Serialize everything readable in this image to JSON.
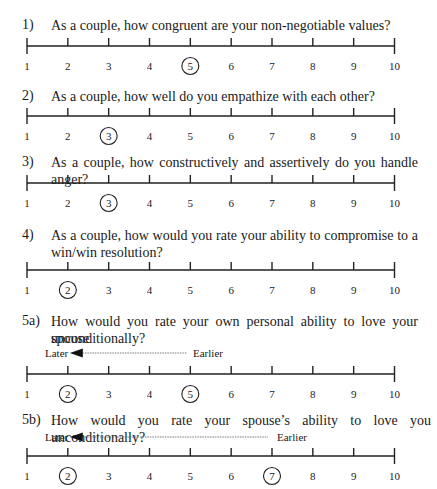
{
  "scale": {
    "min": 1,
    "max": 10,
    "labels": [
      "1",
      "2",
      "3",
      "4",
      "5",
      "6",
      "7",
      "8",
      "9",
      "10"
    ]
  },
  "questions": [
    {
      "number": "1)",
      "text": "As a couple, how congruent are your non-negotiable values?",
      "circled": [
        5
      ]
    },
    {
      "number": "2)",
      "text": "As a couple, how well do you empathize with each other?",
      "circled": [
        3
      ]
    },
    {
      "number": "3)",
      "text": "As a couple, how constructively and assertively do you handle anger?",
      "circled": [
        3
      ]
    },
    {
      "number": "4)",
      "text_line1": "As a couple, how would you rate your ability to compromise to a",
      "text_line2": "win/win resolution?",
      "circled": [
        2
      ]
    },
    {
      "number": "5a)",
      "text_line1": "How would you rate your own personal ability to love your spouse",
      "text_line2": "unconditionally?",
      "circled": [
        2,
        5
      ],
      "arrow": {
        "left_label": "Later",
        "right_label": "Earlier",
        "from": 5,
        "to": 2
      }
    },
    {
      "number": "5b)",
      "text": "How would you rate your spouse’s ability to love you unconditionally?",
      "circled": [
        2,
        7
      ],
      "arrow": {
        "left_label": "Later",
        "right_label": "Earlier",
        "from": 7,
        "to": 2
      }
    }
  ],
  "chart_data": [
    {
      "type": "table",
      "title": "1) As a couple, how congruent are your non-negotiable values?",
      "x": [
        1,
        2,
        3,
        4,
        5,
        6,
        7,
        8,
        9,
        10
      ],
      "selected": [
        5
      ]
    },
    {
      "type": "table",
      "title": "2) As a couple, how well do you empathize with each other?",
      "x": [
        1,
        2,
        3,
        4,
        5,
        6,
        7,
        8,
        9,
        10
      ],
      "selected": [
        3
      ]
    },
    {
      "type": "table",
      "title": "3) As a couple, how constructively and assertively do you handle anger?",
      "x": [
        1,
        2,
        3,
        4,
        5,
        6,
        7,
        8,
        9,
        10
      ],
      "selected": [
        3
      ]
    },
    {
      "type": "table",
      "title": "4) As a couple, how would you rate your ability to compromise to a win/win resolution?",
      "x": [
        1,
        2,
        3,
        4,
        5,
        6,
        7,
        8,
        9,
        10
      ],
      "selected": [
        2
      ]
    },
    {
      "type": "table",
      "title": "5a) How would you rate your own personal ability to love your spouse unconditionally?",
      "x": [
        1,
        2,
        3,
        4,
        5,
        6,
        7,
        8,
        9,
        10
      ],
      "selected": [
        2,
        5
      ],
      "annotations": [
        "Later",
        "Earlier"
      ]
    },
    {
      "type": "table",
      "title": "5b) How would you rate your spouse’s ability to love you unconditionally?",
      "x": [
        1,
        2,
        3,
        4,
        5,
        6,
        7,
        8,
        9,
        10
      ],
      "selected": [
        2,
        7
      ],
      "annotations": [
        "Later",
        "Earlier"
      ]
    }
  ]
}
